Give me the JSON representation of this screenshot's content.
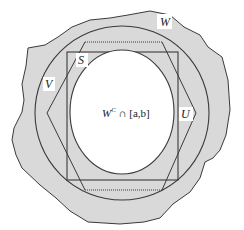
{
  "diagram": {
    "labels": {
      "W": "W",
      "V": "V",
      "S": "S",
      "U": "U",
      "center": "W",
      "center_sup": "C",
      "center_rest": " ∩ [a,b]"
    },
    "colors": {
      "region_fill": "#d9d9d9",
      "outline": "#3a3a3a",
      "inner_fill": "#ffffff",
      "background": "#ffffff"
    },
    "shapes": [
      {
        "name": "W",
        "kind": "irregular-region",
        "style": "filled gray, solid outline"
      },
      {
        "name": "V",
        "kind": "circle",
        "style": "solid outline"
      },
      {
        "name": "U",
        "kind": "hexagon",
        "style": "solid slanted sides, dotted top and bottom"
      },
      {
        "name": "S",
        "kind": "rectangle",
        "style": "solid outline"
      },
      {
        "name": "W^C ∩ [a,b]",
        "kind": "ellipse",
        "style": "white fill, solid outline"
      }
    ]
  }
}
